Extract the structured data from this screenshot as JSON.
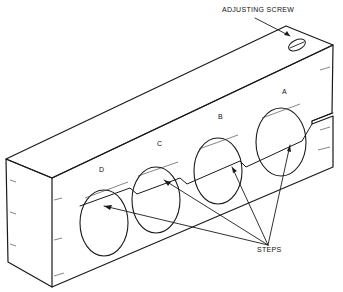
{
  "diagram": {
    "labels": {
      "adjusting_screw": "ADJUSTING SCREW",
      "steps": "STEPS",
      "step_a": "A",
      "step_b": "B",
      "step_c": "C",
      "step_d": "D"
    },
    "colors": {
      "ink": "#1a1a1a",
      "paper": "#ffffff"
    }
  }
}
